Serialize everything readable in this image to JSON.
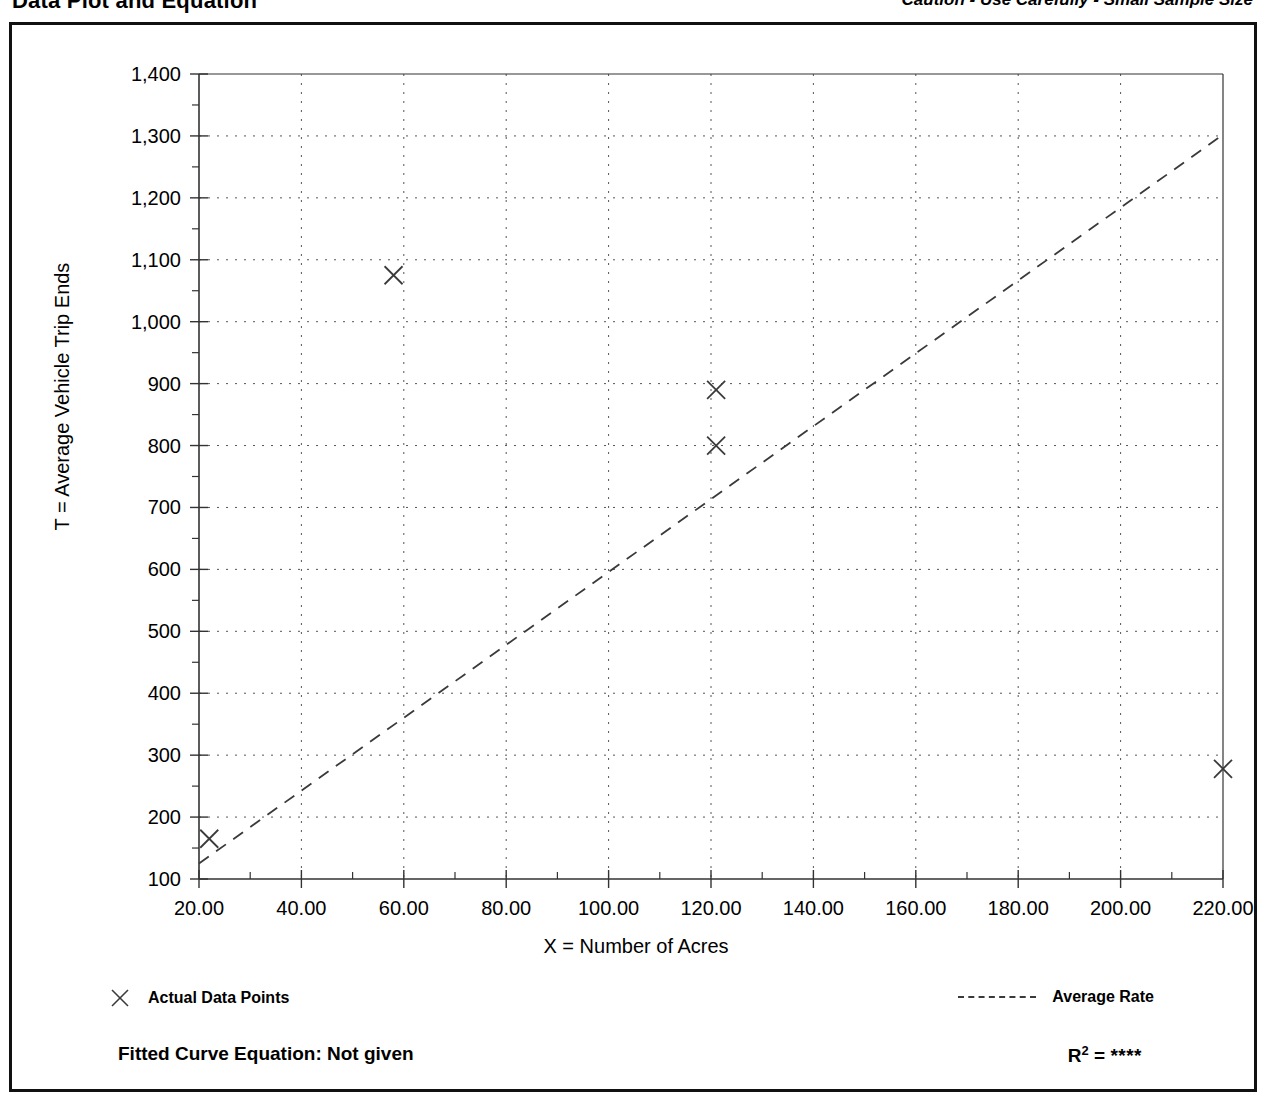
{
  "header": {
    "title": "Data Plot and Equation",
    "caution": "Caution - Use Carefully - Small Sample Size"
  },
  "legend": {
    "data_points_label": "Actual Data Points",
    "average_rate_label": "Average Rate",
    "marker_icon": "x-marker-icon",
    "line_icon": "dashed-line-icon"
  },
  "equation": {
    "fitted_label": "Fitted Curve Equation:  Not given",
    "r_symbol": "R",
    "r_exponent": "2",
    "r_equals": " = ",
    "r_value": "****"
  },
  "colors": {
    "frame": "#111111",
    "axis": "#333333",
    "grid": "#555555",
    "series": "#3a3a3a",
    "background": "#ffffff"
  },
  "chart_data": {
    "type": "scatter",
    "title": "Data Plot and Equation",
    "xlabel": "X = Number of Acres",
    "ylabel": "T = Average Vehicle Trip Ends",
    "xlim": [
      20,
      220
    ],
    "ylim": [
      100,
      1400
    ],
    "xticks": [
      20,
      40,
      60,
      80,
      100,
      120,
      140,
      160,
      180,
      200,
      220
    ],
    "xtick_labels": [
      "20.00",
      "40.00",
      "60.00",
      "80.00",
      "100.00",
      "120.00",
      "140.00",
      "160.00",
      "180.00",
      "200.00",
      "220.00"
    ],
    "yticks": [
      100,
      200,
      300,
      400,
      500,
      600,
      700,
      800,
      900,
      1000,
      1100,
      1200,
      1300,
      1400
    ],
    "ytick_labels": [
      "100",
      "200",
      "300",
      "400",
      "500",
      "600",
      "700",
      "800",
      "900",
      "1,000",
      "1,100",
      "1,200",
      "1,300",
      "1,400"
    ],
    "minor_tick_step_y": 50,
    "minor_tick_step_x": 10,
    "grid": true,
    "grid_style": "dotted",
    "legend_position": "below-plot",
    "series": [
      {
        "name": "Actual Data Points",
        "type": "scatter",
        "marker": "x",
        "points": [
          {
            "x": 22,
            "y": 165
          },
          {
            "x": 58,
            "y": 1075
          },
          {
            "x": 121,
            "y": 890
          },
          {
            "x": 121,
            "y": 800
          },
          {
            "x": 220,
            "y": 278
          }
        ]
      },
      {
        "name": "Average Rate",
        "type": "line",
        "style": "dashed",
        "points": [
          {
            "x": 20,
            "y": 125
          },
          {
            "x": 220,
            "y": 1302
          }
        ]
      }
    ],
    "annotations": {
      "caution": "Caution - Use Carefully - Small Sample Size",
      "fitted_curve_equation": "Not given",
      "r_squared": "****"
    }
  }
}
